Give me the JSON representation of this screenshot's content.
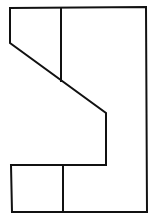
{
  "diagram": {
    "type": "orthographic-view-line-drawing",
    "stroke_color": "#111111",
    "background_color": "#ffffff",
    "outline": {
      "points": [
        [
          10,
          8
        ],
        [
          146,
          7
        ],
        [
          147,
          212
        ],
        [
          12,
          212
        ],
        [
          11,
          165
        ],
        [
          106,
          165
        ],
        [
          106,
          113
        ],
        [
          10,
          43
        ],
        [
          10,
          8
        ]
      ]
    },
    "inner_lines": [
      {
        "name": "upper-vertical-divider",
        "from": [
          61,
          8
        ],
        "to": [
          61,
          81
        ]
      },
      {
        "name": "lower-vertical-divider",
        "from": [
          63,
          165
        ],
        "to": [
          63,
          212
        ]
      }
    ]
  }
}
